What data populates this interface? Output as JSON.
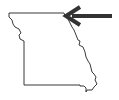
{
  "map": {
    "region": "Missouri state outline",
    "outline_color": "#222222",
    "fill_color": "#ffffff",
    "marker": {
      "type": "arrow",
      "direction": "left",
      "points_to": "northeast corner",
      "color": "#333333"
    }
  }
}
